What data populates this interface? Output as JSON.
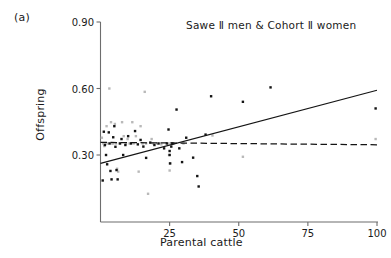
{
  "panel": {
    "label": "(a)"
  },
  "chart_data": {
    "type": "scatter",
    "title": "Sawe Ⅱ men & Cohort Ⅱ women",
    "xlabel": "Parental cattle",
    "ylabel": "Offspring",
    "xlim": [
      0,
      100
    ],
    "ylim": [
      0.0,
      0.9
    ],
    "xticks": [
      25,
      50,
      75,
      100
    ],
    "xtick_labels": [
      "25",
      "50",
      "75",
      "100"
    ],
    "yticks": [
      0.3,
      0.6,
      0.9
    ],
    "ytick_labels": [
      "0.30",
      "0.60",
      "0.90"
    ],
    "grid": false,
    "legend": "none",
    "spines": [
      "left",
      "bottom"
    ],
    "series": [
      {
        "name": "Sawe Ⅱ men",
        "marker": "dot",
        "color": "#141414",
        "points": [
          [
            0.8,
            0.185
          ],
          [
            1.2,
            0.405
          ],
          [
            1.6,
            0.345
          ],
          [
            2.0,
            0.3
          ],
          [
            2.4,
            0.258
          ],
          [
            3.0,
            0.402
          ],
          [
            3.3,
            0.352
          ],
          [
            3.6,
            0.228
          ],
          [
            4.0,
            0.19
          ],
          [
            4.6,
            0.38
          ],
          [
            5.0,
            0.43
          ],
          [
            5.4,
            0.337
          ],
          [
            5.8,
            0.232
          ],
          [
            6.2,
            0.19
          ],
          [
            7.0,
            0.352
          ],
          [
            7.6,
            0.372
          ],
          [
            8.2,
            0.3
          ],
          [
            9.0,
            0.345
          ],
          [
            10.0,
            0.385
          ],
          [
            11.0,
            0.352
          ],
          [
            12.5,
            0.408
          ],
          [
            13.5,
            0.348
          ],
          [
            14.5,
            0.368
          ],
          [
            15.5,
            0.338
          ],
          [
            16.5,
            0.287
          ],
          [
            18.0,
            0.356
          ],
          [
            19.5,
            0.345
          ],
          [
            21.0,
            0.352
          ],
          [
            23.0,
            0.33
          ],
          [
            24.0,
            0.352
          ],
          [
            24.6,
            0.415
          ],
          [
            25.0,
            0.318
          ],
          [
            25.0,
            0.3
          ],
          [
            25.2,
            0.262
          ],
          [
            25.6,
            0.338
          ],
          [
            26.0,
            0.352
          ],
          [
            27.5,
            0.505
          ],
          [
            28.5,
            0.33
          ],
          [
            29.5,
            0.268
          ],
          [
            31.0,
            0.378
          ],
          [
            33.5,
            0.288
          ],
          [
            35.0,
            0.205
          ],
          [
            35.5,
            0.158
          ],
          [
            38.0,
            0.392
          ],
          [
            40.0,
            0.565
          ],
          [
            51.5,
            0.54
          ],
          [
            61.5,
            0.605
          ],
          [
            99.5,
            0.51
          ]
        ]
      },
      {
        "name": "Cohort Ⅱ women",
        "marker": "dot",
        "color": "#b9b9b9",
        "points": [
          [
            0.5,
            0.378
          ],
          [
            1.0,
            0.352
          ],
          [
            1.4,
            0.34
          ],
          [
            1.8,
            0.352
          ],
          [
            2.2,
            0.43
          ],
          [
            2.6,
            0.352
          ],
          [
            3.2,
            0.6
          ],
          [
            3.8,
            0.448
          ],
          [
            4.2,
            0.352
          ],
          [
            4.6,
            0.352
          ],
          [
            5.2,
            0.44
          ],
          [
            5.6,
            0.352
          ],
          [
            6.0,
            0.238
          ],
          [
            6.4,
            0.225
          ],
          [
            7.2,
            0.352
          ],
          [
            7.8,
            0.448
          ],
          [
            8.4,
            0.385
          ],
          [
            9.2,
            0.352
          ],
          [
            9.8,
            0.372
          ],
          [
            10.5,
            0.352
          ],
          [
            11.5,
            0.448
          ],
          [
            12.0,
            0.352
          ],
          [
            12.8,
            0.385
          ],
          [
            13.8,
            0.225
          ],
          [
            14.5,
            0.43
          ],
          [
            15.2,
            0.352
          ],
          [
            16.0,
            0.585
          ],
          [
            16.5,
            0.352
          ],
          [
            17.2,
            0.125
          ],
          [
            18.5,
            0.372
          ],
          [
            19.0,
            0.352
          ],
          [
            20.5,
            0.352
          ],
          [
            22.0,
            0.348
          ],
          [
            24.5,
            0.352
          ],
          [
            24.8,
            0.3
          ],
          [
            25.0,
            0.262
          ],
          [
            25.0,
            0.23
          ],
          [
            25.4,
            0.352
          ],
          [
            26.5,
            0.352
          ],
          [
            30.0,
            0.352
          ],
          [
            40.5,
            0.388
          ],
          [
            51.5,
            0.292
          ],
          [
            99.5,
            0.372
          ]
        ]
      }
    ],
    "trend_lines": [
      {
        "name": "Sawe Ⅱ men fit",
        "style": "solid",
        "color": "#141414",
        "x0": 0,
        "y0": 0.262,
        "x1": 100,
        "y1": 0.592
      },
      {
        "name": "Cohort Ⅱ women fit",
        "style": "dashed",
        "color": "#141414",
        "x0": 0,
        "y0": 0.357,
        "x1": 100,
        "y1": 0.346
      }
    ]
  }
}
